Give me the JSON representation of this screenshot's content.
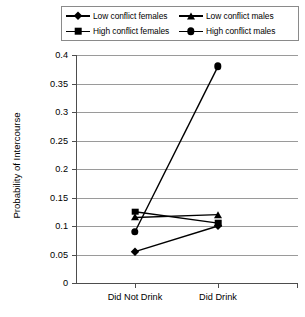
{
  "chart_data": {
    "type": "line",
    "title": "",
    "xlabel": "",
    "ylabel": "Probability of Intercourse",
    "categories": [
      "Did Not Drink",
      "Did Drink"
    ],
    "ylim": [
      0,
      0.4
    ],
    "yticks": [
      "0",
      "0.05",
      "0.1",
      "0.15",
      "0.2",
      "0.25",
      "0.3",
      "0.35",
      "0.4"
    ],
    "ytick_values": [
      0,
      0.05,
      0.1,
      0.15,
      0.2,
      0.25,
      0.3,
      0.35,
      0.4
    ],
    "grid": true,
    "legend_position": "top",
    "series": [
      {
        "name": "Low conflict females",
        "marker": "diamond",
        "values": [
          0.055,
          0.1
        ]
      },
      {
        "name": "High conflict females",
        "marker": "square",
        "values": [
          0.125,
          0.105
        ]
      },
      {
        "name": "Low conflict males",
        "marker": "triangle",
        "values": [
          0.115,
          0.12
        ]
      },
      {
        "name": "High conflict males",
        "marker": "circle",
        "values": [
          0.09,
          0.38
        ]
      }
    ]
  },
  "legend": {
    "entries": [
      {
        "label": "Low conflict females",
        "marker": "diamond"
      },
      {
        "label": "Low conflict males",
        "marker": "triangle"
      },
      {
        "label": "High conflict females",
        "marker": "square"
      },
      {
        "label": "High conflict males",
        "marker": "circle"
      }
    ]
  },
  "axes": {
    "y_title": "Probability of Intercourse",
    "y_labels": [
      "0.4",
      "0.35",
      "0.3",
      "0.25",
      "0.2",
      "0.15",
      "0.1",
      "0.05",
      "0"
    ],
    "x_labels": [
      "Did Not Drink",
      "Did Drink"
    ]
  },
  "colors": {
    "series": "#000000",
    "grid": "#9a9a9a",
    "axis": "#4d4d4d",
    "background": "#ffffff",
    "legend_border": "#8a8a8a"
  }
}
